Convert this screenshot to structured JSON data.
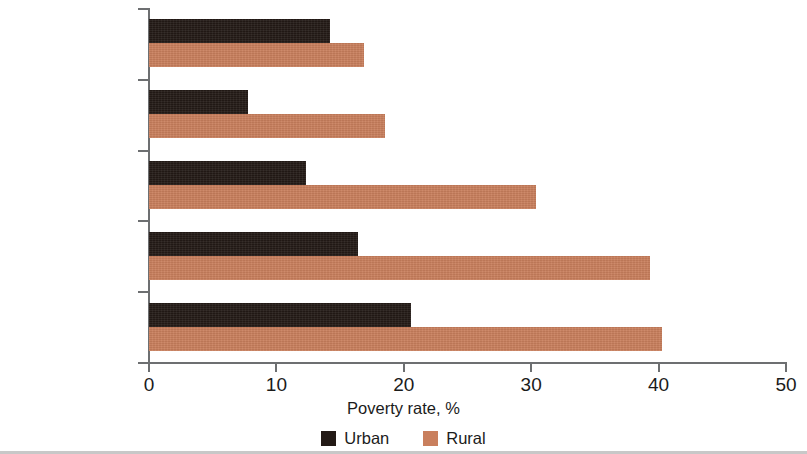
{
  "chart_data": {
    "type": "bar",
    "orientation": "horizontal",
    "title": "",
    "xlabel": "Poverty rate, %",
    "ylabel": "",
    "xlim": [
      0,
      50
    ],
    "xticks": [
      0,
      10,
      20,
      30,
      40,
      50
    ],
    "xtick_labels": [
      "0",
      "10",
      "20",
      "30",
      "40",
      "50"
    ],
    "grid": false,
    "legend_position": "bottom-center",
    "categories": [
      "Jordan",
      "Tunisia",
      "Egypt, Arab Rep.",
      "Iraq",
      "Yemen, Rep."
    ],
    "series": [
      {
        "name": "Urban",
        "color": "#231a16",
        "values": [
          14.2,
          7.8,
          12.3,
          16.4,
          20.6
        ]
      },
      {
        "name": "Rural",
        "color": "#c97f5d",
        "values": [
          16.9,
          18.5,
          30.4,
          39.3,
          40.3
        ]
      }
    ]
  },
  "legend": {
    "items": [
      {
        "label": "Urban",
        "swatch": "legend-swatch-urban"
      },
      {
        "label": "Rural",
        "swatch": "legend-swatch-rural"
      }
    ]
  },
  "axis": {
    "x_title": "Poverty rate, %"
  },
  "colors": {
    "urban": "#231a16",
    "rural": "#c97f5d",
    "axis": "#6d6f71",
    "text": "#1b1b1b",
    "background": "#ffffff"
  }
}
